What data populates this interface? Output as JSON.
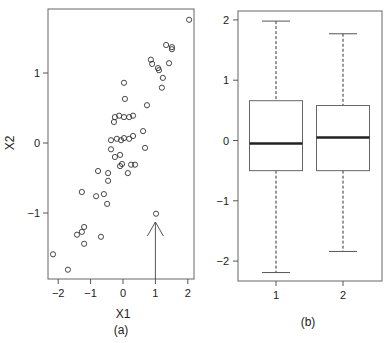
{
  "chart_data": [
    {
      "type": "scatter",
      "panel_label": "(a)",
      "title": "",
      "xlabel": "X1",
      "ylabel": "X2",
      "xlim": [
        -2.3,
        2.2
      ],
      "ylim": [
        -1.95,
        1.92
      ],
      "xticks": [
        -2,
        -1,
        0,
        1,
        2
      ],
      "xtick_labels": [
        "−2",
        "−1",
        "0",
        "1",
        "2"
      ],
      "yticks": [
        -1,
        0,
        1
      ],
      "ytick_labels": [
        "−1",
        "0",
        "1"
      ],
      "grid": false,
      "marker": "open-circle",
      "points": [
        [
          2.04,
          1.76
        ],
        [
          1.33,
          1.4
        ],
        [
          1.51,
          1.37
        ],
        [
          1.51,
          1.34
        ],
        [
          0.86,
          1.19
        ],
        [
          0.9,
          1.13
        ],
        [
          1.42,
          1.14
        ],
        [
          1.08,
          1.07
        ],
        [
          1.11,
          1.04
        ],
        [
          1.23,
          0.93
        ],
        [
          1.2,
          0.79
        ],
        [
          0.03,
          0.86
        ],
        [
          0.06,
          0.63
        ],
        [
          0.74,
          0.54
        ],
        [
          -0.25,
          0.37
        ],
        [
          -0.12,
          0.39
        ],
        [
          0.03,
          0.37
        ],
        [
          0.19,
          0.37
        ],
        [
          0.31,
          0.39
        ],
        [
          -0.28,
          0.3
        ],
        [
          0.62,
          0.17
        ],
        [
          -0.37,
          0.04
        ],
        [
          -0.19,
          0.06
        ],
        [
          -0.06,
          0.04
        ],
        [
          0.03,
          0.07
        ],
        [
          0.19,
          0.06
        ],
        [
          0.31,
          0.1
        ],
        [
          -0.37,
          -0.09
        ],
        [
          0.68,
          -0.07
        ],
        [
          -0.25,
          -0.2
        ],
        [
          -0.09,
          -0.17
        ],
        [
          -0.03,
          -0.3
        ],
        [
          -0.09,
          -0.33
        ],
        [
          0.25,
          -0.31
        ],
        [
          0.37,
          -0.31
        ],
        [
          -0.77,
          -0.4
        ],
        [
          -0.46,
          -0.43
        ],
        [
          0.15,
          -0.43
        ],
        [
          -0.46,
          -0.54
        ],
        [
          -1.27,
          -0.7
        ],
        [
          -0.83,
          -0.76
        ],
        [
          -0.59,
          -0.73
        ],
        [
          -0.49,
          -0.87
        ],
        [
          1.02,
          -1.01
        ],
        [
          -1.2,
          -1.2
        ],
        [
          -1.27,
          -1.27
        ],
        [
          -1.42,
          -1.31
        ],
        [
          -0.68,
          -1.34
        ],
        [
          -1.2,
          -1.44
        ],
        [
          -2.16,
          -1.59
        ],
        [
          -1.7,
          -1.81
        ]
      ],
      "annotations": [
        {
          "type": "arrow",
          "from": [
            1.0,
            -1.95
          ],
          "to": [
            1.0,
            -1.1
          ],
          "points_to": [
            1.02,
            -1.01
          ],
          "text": ""
        }
      ]
    },
    {
      "type": "box",
      "panel_label": "(b)",
      "title": "",
      "xlabel": "",
      "ylabel": "",
      "categories": [
        "1",
        "2"
      ],
      "ylim": [
        -2.35,
        2.15
      ],
      "yticks": [
        -2,
        -1,
        0,
        1,
        2
      ],
      "ytick_labels": [
        "−2",
        "−1",
        "0",
        "1",
        "2"
      ],
      "grid": false,
      "boxes": [
        {
          "label": "1",
          "whisker_low": -2.19,
          "q1": -0.5,
          "median": -0.05,
          "q3": 0.66,
          "whisker_high": 1.98
        },
        {
          "label": "2",
          "whisker_low": -1.84,
          "q1": -0.5,
          "median": 0.05,
          "q3": 0.58,
          "whisker_high": 1.77
        }
      ]
    }
  ],
  "colors": {
    "axis": "#555555",
    "frame": "#666666",
    "marker": "#333333",
    "median": "#222222",
    "text": "#222222"
  }
}
